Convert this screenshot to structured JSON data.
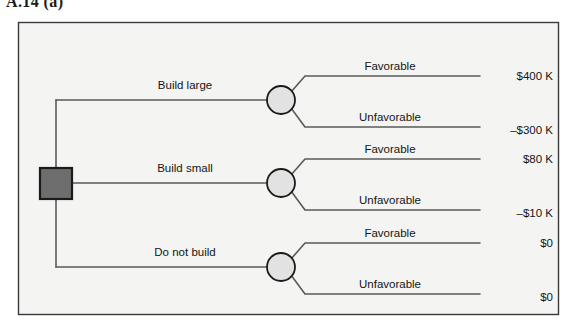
{
  "figure": {
    "label": "A.14  (a)"
  },
  "frame": {
    "border_color": "#3a3a3a",
    "fill_color": "#f4f4f2"
  },
  "nodes": {
    "decision": {
      "name": "decision-node",
      "shape": "square",
      "fill_color": "#6e6e6e",
      "border_color": "#1a1a1a"
    },
    "chance_fill_color": "#e2e2e2",
    "chance_border_color": "#1a1a1a"
  },
  "line_color": "#5a5a5a",
  "branches": [
    {
      "decision_label": "Build large",
      "outcomes": [
        {
          "label": "Favorable",
          "payoff": "$400 K"
        },
        {
          "label": "Unfavorable",
          "payoff": "–$300 K"
        }
      ]
    },
    {
      "decision_label": "Build small",
      "outcomes": [
        {
          "label": "Favorable",
          "payoff": "$80 K"
        },
        {
          "label": "Unfavorable",
          "payoff": "–$10 K"
        }
      ]
    },
    {
      "decision_label": "Do not build",
      "outcomes": [
        {
          "label": "Favorable",
          "payoff": "$0"
        },
        {
          "label": "Unfavorable",
          "payoff": "$0"
        }
      ]
    }
  ]
}
